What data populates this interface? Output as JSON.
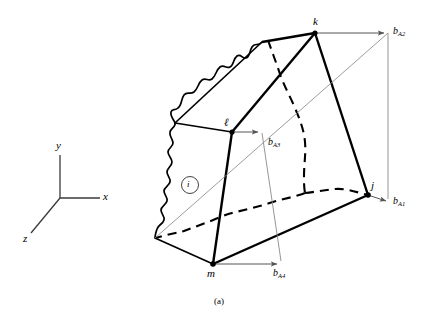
{
  "figure": {
    "caption": "(a)",
    "axes": {
      "x_label": "x",
      "y_label": "y",
      "z_label": "z"
    },
    "nodes": {
      "k": "k",
      "l_script": "ℓ",
      "j": "j",
      "m": "m",
      "element_id": "i"
    },
    "vectors": {
      "b_a1_base": "b",
      "b_a1_sub": "A1",
      "b_a2_base": "b",
      "b_a2_sub": "A2",
      "b_a3_base": "b",
      "b_a3_sub": "A3",
      "b_a4_base": "b",
      "b_a4_sub": "A4"
    },
    "colors": {
      "stroke_heavy": "#000000",
      "stroke_thin": "#000000",
      "construction": "#8a8a8a",
      "background": "#ffffff"
    }
  }
}
